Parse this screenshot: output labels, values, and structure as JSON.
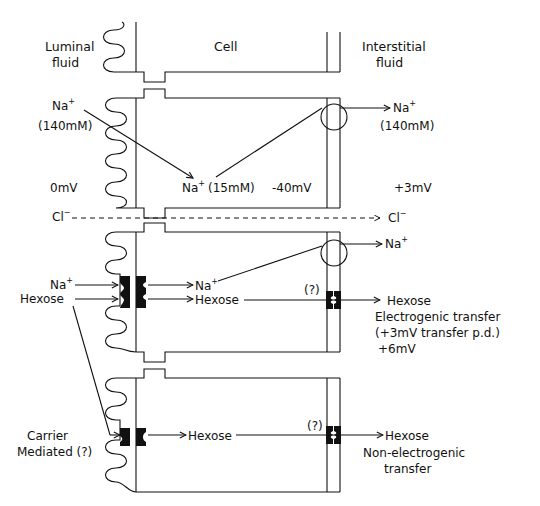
{
  "regions": {
    "luminal": [
      "Luminal",
      "fluid"
    ],
    "cell": "Cell",
    "interstitial": [
      "Interstitial",
      "fluid"
    ]
  },
  "section1": {
    "na_luminal": "Na",
    "na_luminal_conc": "(140mM)",
    "na_cell": "Na",
    "na_cell_conc": "(15mM)",
    "na_interstitial": "Na",
    "na_interstitial_conc": "(140mM)",
    "potential_luminal": "0mV",
    "potential_cell": "-40mV",
    "potential_interstitial": "+3mV",
    "plus": "+"
  },
  "chloride": {
    "left": "Cl",
    "right": "Cl",
    "minus": "−"
  },
  "section2": {
    "na_in": "Na",
    "hexose_in": "Hexose",
    "na_cell": "Na",
    "hexose_cell": "Hexose",
    "na_out": "Na",
    "uncertain": "(?)",
    "hexose_out": "Hexose",
    "transfer_type": "Electrogenic transfer",
    "transfer_pd": "(+3mV transfer p.d.)",
    "potential": "+6mV",
    "plus": "+"
  },
  "section3": {
    "carrier": [
      "Carrier",
      "Mediated (?)"
    ],
    "hexose_cell": "Hexose",
    "uncertain": "(?)",
    "hexose_out": "Hexose",
    "transfer_type": [
      "Non-electrogenic",
      "transfer"
    ]
  },
  "colors": {
    "ink": "#111111",
    "background": "#ffffff"
  }
}
